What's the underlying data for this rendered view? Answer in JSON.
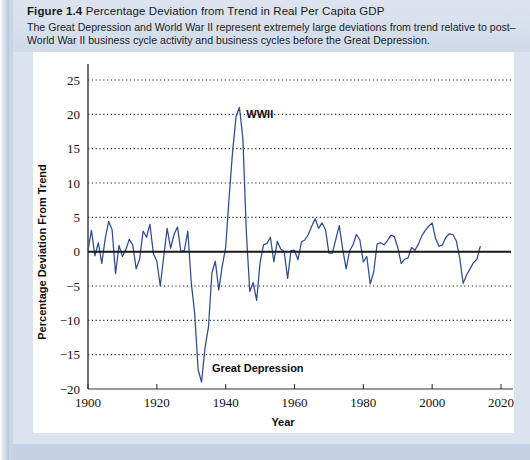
{
  "figure": {
    "label": "Figure 1.4",
    "title": "Percentage Deviation from Trend in Real Per Capita GDP",
    "caption_line1": "The Great Depression and World War II represent extremely large deviations from trend relative to post–",
    "caption_line2": "World War II business cycle activity and business cycles before the Great Depression."
  },
  "colors": {
    "line": "#2f4b8f",
    "zero_line": "#1a1a1a",
    "grid": "#222222",
    "page_background": "#c9d4e4",
    "header_band": "#d8e0ed",
    "plot_background": "#ffffff"
  },
  "chart_data": {
    "type": "line",
    "title": "Percentage Deviation from Trend in Real Per Capita GDP",
    "xlabel": "Year",
    "ylabel": "Percentage Deviation From Trend",
    "xlim": [
      1900,
      2020
    ],
    "ylim": [
      -20,
      25
    ],
    "xticks": [
      1900,
      1920,
      1940,
      1960,
      1980,
      2000,
      2020
    ],
    "yticks": [
      -20,
      -15,
      -10,
      -5,
      0,
      5,
      10,
      15,
      20,
      25
    ],
    "xtick_labels": [
      "1900",
      "1920",
      "1940",
      "1960",
      "1980",
      "2000",
      "2020"
    ],
    "ytick_labels": [
      "−20",
      "−15",
      "−10",
      "−5",
      "0",
      "5",
      "10",
      "15",
      "20",
      "25"
    ],
    "grid": "horizontal-dotted",
    "zero_reference_line": 0,
    "legend": "none",
    "annotations": [
      {
        "text": "WWII",
        "year": 1946,
        "value": 19.5
      },
      {
        "text": "Great Depression",
        "year": 1936,
        "value": -17.5
      }
    ],
    "series": [
      {
        "name": "Percentage deviation from trend",
        "x": [
          1900,
          1901,
          1902,
          1903,
          1904,
          1905,
          1906,
          1907,
          1908,
          1909,
          1910,
          1911,
          1912,
          1913,
          1914,
          1915,
          1916,
          1917,
          1918,
          1919,
          1920,
          1921,
          1922,
          1923,
          1924,
          1925,
          1926,
          1927,
          1928,
          1929,
          1930,
          1931,
          1932,
          1933,
          1934,
          1935,
          1936,
          1937,
          1938,
          1939,
          1940,
          1941,
          1942,
          1943,
          1944,
          1945,
          1946,
          1947,
          1948,
          1949,
          1950,
          1951,
          1952,
          1953,
          1954,
          1955,
          1956,
          1957,
          1958,
          1959,
          1960,
          1961,
          1962,
          1963,
          1964,
          1965,
          1966,
          1967,
          1968,
          1969,
          1970,
          1971,
          1972,
          1973,
          1974,
          1975,
          1976,
          1977,
          1978,
          1979,
          1980,
          1981,
          1982,
          1983,
          1984,
          1985,
          1986,
          1987,
          1988,
          1989,
          1990,
          1991,
          1992,
          1993,
          1994,
          1995,
          1996,
          1997,
          1998,
          1999,
          2000,
          2001,
          2002,
          2003,
          2004,
          2005,
          2006,
          2007,
          2008,
          2009,
          2010,
          2011,
          2012,
          2013,
          2014
        ],
        "values": [
          0.2,
          3.1,
          -0.6,
          1.3,
          -1.7,
          1.9,
          4.4,
          3.2,
          -3.2,
          0.9,
          -0.7,
          0.3,
          1.8,
          1.0,
          -2.5,
          -1.1,
          3.0,
          2.1,
          4.0,
          -0.3,
          -1.4,
          -5.0,
          -0.7,
          3.4,
          0.5,
          2.5,
          3.6,
          0.0,
          0.2,
          3.0,
          -4.5,
          -9.0,
          -17.2,
          -19.0,
          -14.0,
          -11.0,
          -3.1,
          -1.4,
          -5.6,
          -2.1,
          0.6,
          7.9,
          14.5,
          19.6,
          21.0,
          16.5,
          2.9,
          -5.8,
          -4.5,
          -7.1,
          -1.6,
          1.0,
          1.2,
          2.1,
          -1.5,
          1.5,
          0.4,
          0.0,
          -3.9,
          0.2,
          0.2,
          -1.2,
          1.4,
          1.7,
          2.5,
          3.7,
          4.8,
          3.4,
          4.2,
          3.2,
          -0.2,
          -0.2,
          1.8,
          3.8,
          0.4,
          -2.5,
          0.1,
          1.0,
          2.5,
          1.7,
          -1.5,
          -0.7,
          -4.7,
          -3.0,
          1.1,
          1.3,
          1.0,
          1.6,
          2.4,
          2.2,
          0.6,
          -1.7,
          -1.1,
          -0.9,
          0.6,
          0.2,
          1.1,
          2.3,
          3.1,
          3.7,
          4.2,
          1.9,
          0.8,
          1.0,
          2.1,
          2.6,
          2.5,
          1.6,
          -0.9,
          -4.6,
          -3.4,
          -2.5,
          -1.6,
          -1.1,
          0.8
        ]
      }
    ]
  }
}
